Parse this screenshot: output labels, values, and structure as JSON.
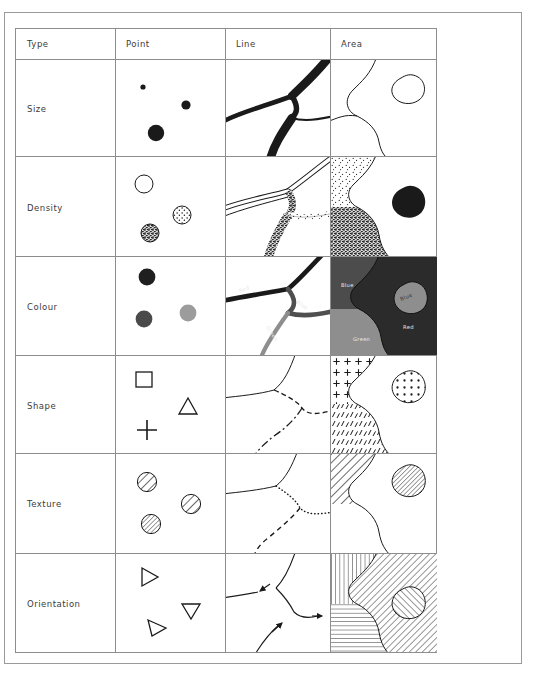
{
  "figure": {
    "kind": "visual-variables-matrix",
    "columns": [
      "Type",
      "Point",
      "Line",
      "Area"
    ],
    "rows": [
      "Size",
      "Density",
      "Colour",
      "Shape",
      "Texture",
      "Orientation"
    ]
  },
  "headers": {
    "type": "Type",
    "point": "Point",
    "line": "Line",
    "area": "Area"
  },
  "rows": {
    "size": "Size",
    "density": "Density",
    "colour": "Colour",
    "shape": "Shape",
    "texture": "Texture",
    "orientation": "Orientation"
  },
  "annotations": {
    "line_colour": {
      "red": "Red",
      "blue": "Blue",
      "green": "Green"
    },
    "area_colour": {
      "blue_big": "Blue",
      "blue_small": "Blue",
      "red": "Red",
      "green": "Green"
    }
  },
  "palette": {
    "ink": "#1a1a1a",
    "grid": "#8d8d8d",
    "frame": "#9a9a9a",
    "text": "#3b3b3b",
    "grey_dark": "#3f3f3f",
    "grey_mid": "#6e6e6e",
    "grey_light": "#a9a9a9",
    "area_blue": "#4c4c4c",
    "area_red": "#2b2b2b",
    "area_green": "#8e8e8e",
    "label_light": "#e8e8e8"
  },
  "cells": {
    "size_point": {
      "symbols": "three filled circles of increasing radius",
      "radii_px": [
        2.6,
        4.6,
        8.2
      ]
    },
    "size_line": {
      "symbols": "river/road network with increasing stroke width",
      "widths_px": [
        2.2,
        4.5,
        8.5
      ]
    },
    "size_area": {
      "symbols": "outlined polygons of differing size, no fill"
    },
    "density_point": {
      "symbols": "circles with increasing dot-fill density",
      "fills": [
        "none",
        "medium stipple",
        "dense stipple"
      ]
    },
    "density_line": {
      "symbols": "lines rendered as stipple bands of increasing density"
    },
    "density_area": {
      "symbols": "regions with sparse stipple, dense stipple and solid fill"
    },
    "colour_point": {
      "symbols": "circles in black, dark grey and light grey"
    },
    "colour_line": {
      "symbols": "labelled lines in black, dark grey and mid grey"
    },
    "colour_area": {
      "symbols": "labelled regions in distinct grey tones"
    },
    "shape_point": {
      "symbols": "square, triangle and plus marker"
    },
    "shape_line": {
      "symbols": "solid, dashed and dash-dot lines"
    },
    "shape_area": {
      "symbols": "plus-symbol fill, dash fill and dot fill"
    },
    "texture_point": {
      "symbols": "circles with coarse, fine and very fine hatching"
    },
    "texture_line": {
      "symbols": "solid, dotted and dashed lines"
    },
    "texture_area": {
      "symbols": "regions with coarse and fine diagonal hatching"
    },
    "orientation_point": {
      "symbols": "triangles rotated to different headings"
    },
    "orientation_line": {
      "symbols": "lines carrying directional arrowheads"
    },
    "orientation_area": {
      "symbols": "regions hatched vertically, horizontally and diagonally"
    }
  }
}
